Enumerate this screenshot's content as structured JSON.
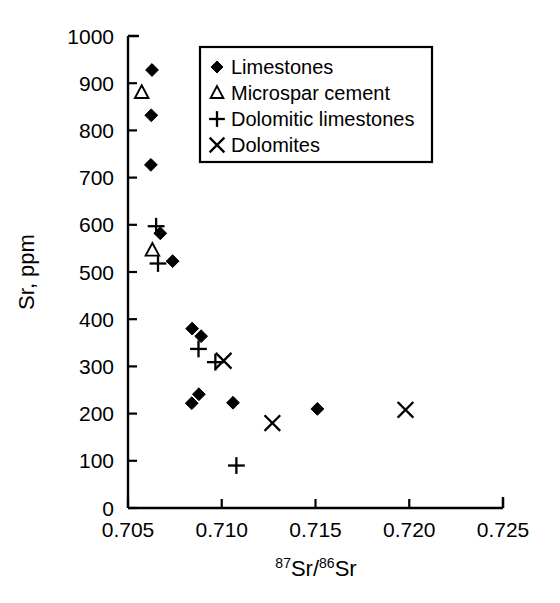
{
  "chart_data": {
    "type": "scatter",
    "title": "",
    "xlabel": "87Sr/86Sr",
    "xlabel_parts": {
      "sup1": "87",
      "base1": "Sr/",
      "sup2": "86",
      "base2": "Sr"
    },
    "ylabel": "Sr, ppm",
    "xlim": [
      0.705,
      0.725
    ],
    "ylim": [
      0,
      1000
    ],
    "xticks": [
      "0.705",
      "0.710",
      "0.715",
      "0.720",
      "0.725"
    ],
    "xtick_values": [
      0.705,
      0.71,
      0.715,
      0.72,
      0.725
    ],
    "yticks": [
      "0",
      "100",
      "200",
      "300",
      "400",
      "500",
      "600",
      "700",
      "800",
      "900",
      "1000"
    ],
    "ytick_values": [
      0,
      100,
      200,
      300,
      400,
      500,
      600,
      700,
      800,
      900,
      1000
    ],
    "grid": false,
    "legend_position": "top-right",
    "series": [
      {
        "name": "Limestones",
        "marker": "diamond",
        "points": [
          {
            "x": 0.70628,
            "y": 928
          },
          {
            "x": 0.70624,
            "y": 832
          },
          {
            "x": 0.70622,
            "y": 727
          },
          {
            "x": 0.70672,
            "y": 582
          },
          {
            "x": 0.70738,
            "y": 523
          },
          {
            "x": 0.70842,
            "y": 380
          },
          {
            "x": 0.7089,
            "y": 364
          },
          {
            "x": 0.7084,
            "y": 222
          },
          {
            "x": 0.70878,
            "y": 241
          },
          {
            "x": 0.7106,
            "y": 223
          },
          {
            "x": 0.7151,
            "y": 210
          }
        ]
      },
      {
        "name": "Microspar cement",
        "marker": "triangle",
        "points": [
          {
            "x": 0.70573,
            "y": 880
          },
          {
            "x": 0.7063,
            "y": 546
          }
        ]
      },
      {
        "name": "Dolomitic limestones",
        "marker": "plus",
        "points": [
          {
            "x": 0.7065,
            "y": 597
          },
          {
            "x": 0.7066,
            "y": 518
          },
          {
            "x": 0.70876,
            "y": 337
          },
          {
            "x": 0.70966,
            "y": 309
          },
          {
            "x": 0.71078,
            "y": 90
          }
        ]
      },
      {
        "name": "Dolomites",
        "marker": "cross",
        "points": [
          {
            "x": 0.7101,
            "y": 312
          },
          {
            "x": 0.7127,
            "y": 180
          },
          {
            "x": 0.7198,
            "y": 208
          }
        ]
      }
    ]
  },
  "legend": {
    "items": [
      {
        "marker": "diamond",
        "label": "Limestones"
      },
      {
        "marker": "triangle",
        "label": "Microspar cement"
      },
      {
        "marker": "plus",
        "label": "Dolomitic limestones"
      },
      {
        "marker": "cross",
        "label": "Dolomites"
      }
    ]
  }
}
